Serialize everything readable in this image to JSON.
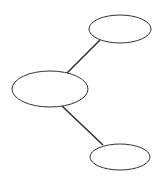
{
  "diagram": {
    "type": "tree",
    "background": "#ffffff",
    "stroke_color": "#333333",
    "nodes": [
      {
        "id": "node-top",
        "label": "",
        "cx": 120,
        "cy": 29,
        "rx": 31,
        "ry": 14
      },
      {
        "id": "node-middle",
        "label": "",
        "cx": 50,
        "cy": 89,
        "rx": 38,
        "ry": 18
      },
      {
        "id": "node-bottom",
        "label": "",
        "cx": 120,
        "cy": 157,
        "rx": 30,
        "ry": 13
      }
    ],
    "edges": [
      {
        "from": "node-middle",
        "to": "node-top",
        "x1": 67,
        "y1": 73,
        "x2": 100,
        "y2": 40
      },
      {
        "from": "node-middle",
        "to": "node-bottom",
        "x1": 62,
        "y1": 106,
        "x2": 103,
        "y2": 145
      }
    ]
  }
}
